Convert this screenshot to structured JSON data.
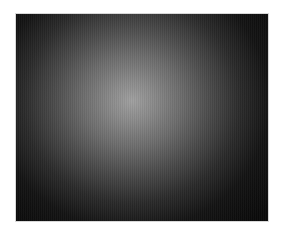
{
  "image": {
    "description": "Radial gradient: light gray center fading to near-black edges",
    "colors": {
      "center": "#a0a0a0",
      "edge": "#0a0a0a",
      "background": "#ffffff"
    }
  }
}
